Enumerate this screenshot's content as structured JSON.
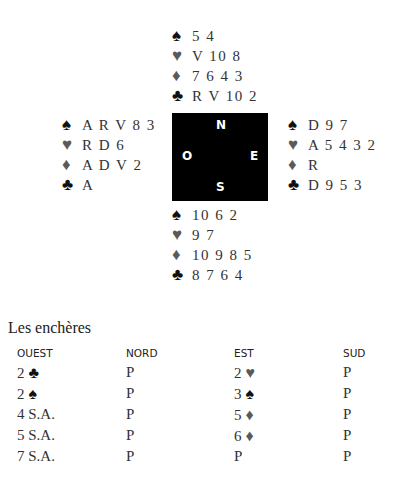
{
  "hands": {
    "north": {
      "spades": "5 4",
      "hearts": "V 10 8",
      "diamonds": "7 6 4 3",
      "clubs": "R V 10 2"
    },
    "west": {
      "spades": "A R V 8 3",
      "hearts": "R D 6",
      "diamonds": "A D V 2",
      "clubs": "A"
    },
    "east": {
      "spades": "D 9 7",
      "hearts": "A 5 4 3 2",
      "diamonds": "R",
      "clubs": "D 9 5 3"
    },
    "south": {
      "spades": "10 6 2",
      "hearts": "9 7",
      "diamonds": "10 9 8 5",
      "clubs": "8 7 6 4"
    }
  },
  "suit_symbols": {
    "spades": "♠",
    "hearts": "♥",
    "diamonds": "♦",
    "clubs": "♣"
  },
  "compass": {
    "n": "N",
    "o": "O",
    "e": "E",
    "s": "S"
  },
  "auction": {
    "title": "Les enchères",
    "headers": [
      "OUEST",
      "NORD",
      "EST",
      "SUD"
    ],
    "rows": [
      [
        {
          "t": "2",
          "s": "♣",
          "c": "black"
        },
        {
          "t": "P"
        },
        {
          "t": "2",
          "s": "♥",
          "c": "gray"
        },
        {
          "t": "P"
        }
      ],
      [
        {
          "t": "2",
          "s": "♠",
          "c": "black"
        },
        {
          "t": "P"
        },
        {
          "t": "3",
          "s": "♠",
          "c": "black"
        },
        {
          "t": "P"
        }
      ],
      [
        {
          "t": "4 S.A."
        },
        {
          "t": "P"
        },
        {
          "t": "5",
          "s": "♦",
          "c": "gray"
        },
        {
          "t": "P"
        }
      ],
      [
        {
          "t": "5 S.A."
        },
        {
          "t": "P"
        },
        {
          "t": "6",
          "s": "♦",
          "c": "gray"
        },
        {
          "t": "P"
        }
      ],
      [
        {
          "t": "7 S.A."
        },
        {
          "t": "P"
        },
        {
          "t": "P"
        },
        {
          "t": "P"
        }
      ]
    ]
  },
  "colors": {
    "black_suit": "#111111",
    "red_suit": "#5a5a5a",
    "compass_bg": "#000000"
  }
}
